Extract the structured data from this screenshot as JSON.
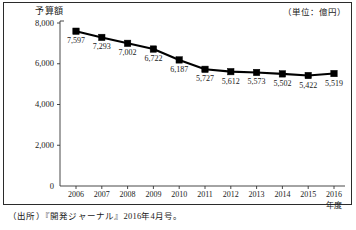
{
  "chart_data": {
    "type": "line",
    "title": "予算額",
    "subtitle": "（単位：億円）",
    "xlabel": "年度",
    "ylabel": "",
    "categories": [
      "2006",
      "2007",
      "2008",
      "2009",
      "2010",
      "2011",
      "2012",
      "2013",
      "2014",
      "2015",
      "2016"
    ],
    "values": [
      7597,
      7293,
      7002,
      6722,
      6187,
      5727,
      5612,
      5573,
      5502,
      5422,
      5519
    ],
    "point_labels": [
      "7,597",
      "7,293",
      "7,002",
      "6,722",
      "6,187",
      "5,727",
      "5,612",
      "5,573",
      "5,502",
      "5,422",
      "5,519"
    ],
    "ylim": [
      0,
      8000
    ],
    "yticks": [
      0,
      2000,
      4000,
      6000,
      8000
    ],
    "ytick_labels": [
      "0",
      "2,000",
      "4,000",
      "6,000",
      "8,000"
    ],
    "grid": false,
    "legend": null,
    "marker": "square",
    "line_color": "#000000",
    "marker_color": "#000000",
    "axis_color": "#333333"
  },
  "source": {
    "note": "（出所）『開発ジャーナル』2016年4月号。"
  }
}
